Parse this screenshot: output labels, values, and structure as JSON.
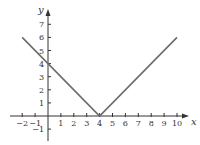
{
  "chart_data": {
    "type": "line",
    "title": "",
    "function": "y = |x - 4|",
    "xlabel": "x",
    "ylabel": "y",
    "xlim": [
      -2.5,
      11
    ],
    "ylim": [
      -1.5,
      8
    ],
    "grid": false,
    "legend": null,
    "x_ticks": [
      -2,
      -1,
      1,
      2,
      3,
      4,
      5,
      6,
      7,
      8,
      9,
      10
    ],
    "x_tick_labels": [
      "−2",
      "−1",
      "1",
      "2",
      "3",
      "4",
      "5",
      "6",
      "7",
      "8",
      "9",
      "10"
    ],
    "y_ticks": [
      -1,
      1,
      2,
      3,
      4,
      5,
      6,
      7
    ],
    "y_tick_labels": [
      "−1",
      "1",
      "2",
      "3",
      "4",
      "5",
      "6",
      "7"
    ],
    "series": [
      {
        "name": "y = |x − 4|",
        "x": [
          -2,
          4,
          10
        ],
        "y": [
          6,
          0,
          6
        ],
        "color": "#6b6b6b"
      }
    ]
  },
  "colors": {
    "axis": "#333333",
    "line": "#6b6b6b"
  }
}
